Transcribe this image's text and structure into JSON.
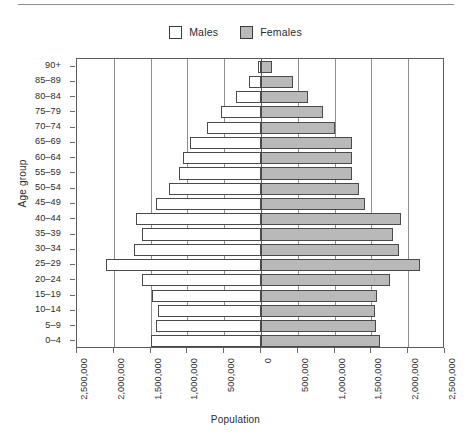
{
  "legend": {
    "items": [
      {
        "label": "Males",
        "color": "#ffffff",
        "icon": "square-outline-icon"
      },
      {
        "label": "Females",
        "color": "#b9b9b9",
        "icon": "square-filled-icon"
      }
    ]
  },
  "axes": {
    "y_title": "Age group",
    "x_title": "Population"
  },
  "chart_data": {
    "type": "bar",
    "subtype": "population-pyramid",
    "title": "",
    "xlabel": "Population",
    "ylabel": "Age group",
    "orientation": "horizontal",
    "grid": true,
    "legend_position": "top-center",
    "xlim": [
      -2500000,
      2500000
    ],
    "xticks": [
      -2500000,
      -2000000,
      -1500000,
      -1000000,
      -500000,
      0,
      500000,
      1000000,
      1500000,
      2000000,
      2500000
    ],
    "xtick_labels": [
      "2,500,000",
      "2,000,000",
      "1,500,000",
      "1,000,000",
      "500,000",
      "0",
      "500,000",
      "1,000,000",
      "1,500,000",
      "2,000,000",
      "2,500,000"
    ],
    "categories": [
      "90+",
      "85-89",
      "80-84",
      "75-79",
      "70-74",
      "65-69",
      "60-64",
      "55-59",
      "50-54",
      "45-49",
      "40-44",
      "35-39",
      "30-34",
      "25-29",
      "20-24",
      "15-19",
      "10-14",
      "5-9",
      "0-4"
    ],
    "series": [
      {
        "name": "Males",
        "color": "#ffffff",
        "direction": "left",
        "values": [
          35000,
          160000,
          340000,
          540000,
          740000,
          960000,
          1060000,
          1120000,
          1250000,
          1420000,
          1700000,
          1620000,
          1720000,
          2110000,
          1620000,
          1480000,
          1400000,
          1420000,
          1490000
        ]
      },
      {
        "name": "Females",
        "color": "#b9b9b9",
        "direction": "right",
        "values": [
          150000,
          430000,
          640000,
          840000,
          1000000,
          1240000,
          1230000,
          1230000,
          1330000,
          1410000,
          1900000,
          1790000,
          1870000,
          2160000,
          1750000,
          1580000,
          1550000,
          1560000,
          1620000
        ]
      }
    ]
  }
}
